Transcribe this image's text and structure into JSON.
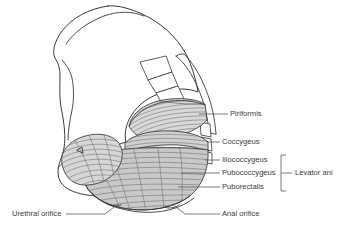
{
  "figure": {
    "background_color": "#ffffff",
    "line_color": "#3a3a3a",
    "label_color": "#3b3b3b",
    "leader_color": "#5a5a5a",
    "muscle_fill_light": "#e3e3e3",
    "muscle_fill_mid": "#cfcfcf",
    "muscle_fill_dark": "#bdbdbd",
    "width": 338,
    "height": 235
  },
  "labels": {
    "piriformis": "Piriformis",
    "coccygeus": "Coccygeus",
    "iliococcygeus": "Iliococcygeus",
    "pubococcygeus": "Pubococcygeus",
    "puborectalis": "Puborectalis",
    "levator_ani": "Levator ani",
    "urethral_orifice": "Urethral orifice",
    "anal_orifice": "Anal orifice"
  },
  "label_list": [
    {
      "id": "piriformis",
      "text": "Piriformis",
      "x": 230,
      "y": 114,
      "anchor": "start"
    },
    {
      "id": "coccygeus",
      "text": "Coccygeus",
      "x": 222,
      "y": 142,
      "anchor": "start"
    },
    {
      "id": "iliococcygeus",
      "text": "Iliococcygeus",
      "x": 222,
      "y": 160,
      "anchor": "start"
    },
    {
      "id": "pubococcygeus",
      "text": "Pubococcygeus",
      "x": 222,
      "y": 173,
      "anchor": "start"
    },
    {
      "id": "puborectalis",
      "text": "Puborectalis",
      "x": 222,
      "y": 187,
      "anchor": "start"
    },
    {
      "id": "levator_ani",
      "text": "Levator ani",
      "x": 295,
      "y": 173,
      "anchor": "start"
    },
    {
      "id": "urethral_orifice",
      "text": "Urethral orifice",
      "x": 12,
      "y": 217,
      "anchor": "start"
    },
    {
      "id": "anal_orifice",
      "text": "Anal orifice",
      "x": 222,
      "y": 217,
      "anchor": "start"
    }
  ],
  "structures": {
    "hip_bone": "hip-bone-outline",
    "sacrum": "sacrum-vertebrae",
    "coccyx": "coccyx-vertebrae",
    "piriformis_muscle": "piriformis-muscle",
    "coccygeus_muscle": "coccygeus-muscle",
    "levator_ani_sheet": "levator-ani-muscle-sheet",
    "obturator_internus": "obturator-internus-muscle",
    "urethral_opening": "urethral-orifice-marker",
    "anal_opening": "anal-orifice-marker"
  }
}
